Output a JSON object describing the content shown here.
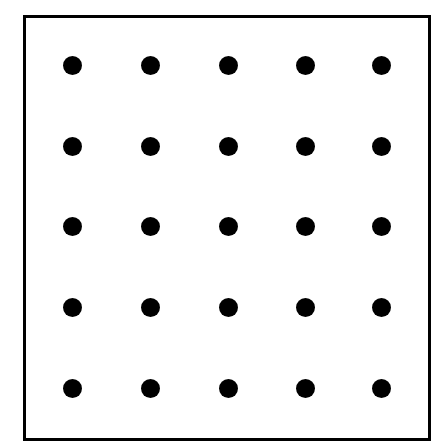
{
  "diagram": {
    "rows": 5,
    "cols": 5,
    "dot_color": "#000000",
    "border_color": "#000000",
    "background": "#ffffff",
    "col_centers_px": [
      72,
      150,
      228,
      305,
      381
    ],
    "row_centers_px": [
      65,
      146,
      226,
      307,
      388
    ]
  }
}
